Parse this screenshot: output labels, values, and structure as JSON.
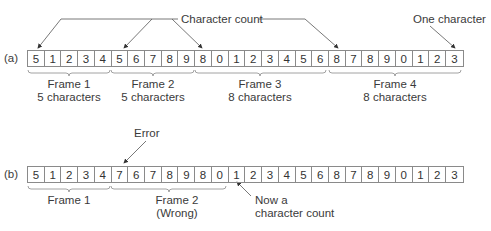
{
  "diagram": {
    "part_a": {
      "label": "(a)",
      "cells": [
        "5",
        "1",
        "2",
        "3",
        "4",
        "5",
        "6",
        "7",
        "8",
        "9",
        "8",
        "0",
        "1",
        "2",
        "3",
        "4",
        "5",
        "6",
        "8",
        "7",
        "8",
        "9",
        "0",
        "1",
        "2",
        "3"
      ],
      "annotations": {
        "character_count": "Character count",
        "one_character": "One character"
      },
      "frames": [
        {
          "name": "Frame 1",
          "size": "5 characters"
        },
        {
          "name": "Frame 2",
          "size": "5 characters"
        },
        {
          "name": "Frame 3",
          "size": "8 characters"
        },
        {
          "name": "Frame 4",
          "size": "8 characters"
        }
      ]
    },
    "part_b": {
      "label": "(b)",
      "cells": [
        "5",
        "1",
        "2",
        "3",
        "4",
        "7",
        "6",
        "7",
        "8",
        "9",
        "8",
        "0",
        "1",
        "2",
        "3",
        "4",
        "5",
        "6",
        "8",
        "7",
        "8",
        "9",
        "0",
        "1",
        "2",
        "3"
      ],
      "annotations": {
        "error": "Error",
        "now_count_line1": "Now a",
        "now_count_line2": "character count"
      },
      "frames": [
        {
          "name": "Frame 1",
          "size": ""
        },
        {
          "name": "Frame 2",
          "size": "(Wrong)"
        }
      ]
    },
    "colors": {
      "stroke": "#8a8a8a",
      "text": "#333333",
      "arrow": "#444444"
    }
  }
}
